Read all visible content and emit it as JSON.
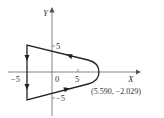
{
  "diagram": {
    "type": "contour-plot",
    "axes": {
      "x_label": "X",
      "y_label": "Y",
      "x_ticks": [
        {
          "value": -5,
          "label": "−5"
        },
        {
          "value": 0,
          "label": "0"
        },
        {
          "value": 5,
          "label": "5"
        }
      ],
      "y_ticks": [
        {
          "value": 5,
          "label": "5"
        },
        {
          "value": -5,
          "label": "−5"
        }
      ]
    },
    "contour": {
      "description": "Closed contour: vertical segment at X=-5 from Y=5 to Y=-5, slanted segments to the right joined by a rounded arc crossing the X axis",
      "left_edge_x": -5,
      "top_y_at_left": 5,
      "bottom_y_at_left": -5,
      "rightmost_x": 9,
      "direction": "counterclockwise (down left edge, right along bottom, around arc, left along top)"
    },
    "annotation": {
      "label": "(5.590, −2.029)"
    },
    "colors": {
      "stroke": "#222222",
      "axis": "#555555",
      "text": "#333333"
    }
  }
}
